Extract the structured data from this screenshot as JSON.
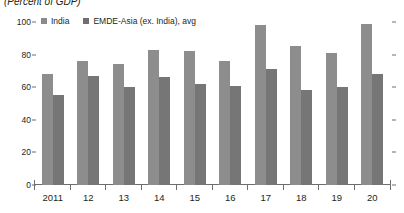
{
  "subtitle": "(Percent of GDP)",
  "legend": {
    "position": "top-left",
    "items": [
      {
        "label": "India",
        "color": "#8d8d8d",
        "swatch": "square-swatch-icon"
      },
      {
        "label": "EMDE-Asia (ex. India), avg",
        "color": "#767676",
        "swatch": "square-swatch-icon"
      }
    ]
  },
  "chart_data": {
    "type": "bar",
    "title": "",
    "subtitle": "(Percent of GDP)",
    "xlabel": "",
    "ylabel": "",
    "ylim": [
      0,
      100
    ],
    "yticks": [
      0,
      20,
      40,
      60,
      80,
      100
    ],
    "ytick_labels": [
      "0",
      "20",
      "40",
      "60",
      "80",
      "100"
    ],
    "grid": false,
    "categories": [
      "2011",
      "12",
      "13",
      "14",
      "15",
      "16",
      "17",
      "18",
      "19",
      "20"
    ],
    "series": [
      {
        "name": "India",
        "color": "#8d8d8d",
        "values": [
          68,
          76,
          74,
          83,
          82,
          76,
          98,
          85,
          81,
          99
        ]
      },
      {
        "name": "EMDE-Asia (ex. India), avg",
        "color": "#767676",
        "values": [
          55,
          67,
          60,
          66,
          62,
          61,
          71,
          58,
          60,
          68
        ]
      }
    ]
  }
}
